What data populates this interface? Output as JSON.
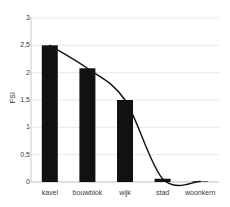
{
  "chart_data": {
    "type": "bar",
    "title": "",
    "subtitle": "",
    "xlabel": "",
    "ylabel": "FSI",
    "categories": [
      "kavel",
      "bouwblok",
      "wijk",
      "stad",
      "woonkern"
    ],
    "values": [
      2.5,
      2.08,
      1.5,
      0.06,
      0.01
    ],
    "series": [
      {
        "name": "FSI",
        "type": "bar",
        "values": [
          2.5,
          2.08,
          1.5,
          0.06,
          0.01
        ]
      },
      {
        "name": "FSI trend curve",
        "type": "line",
        "values": [
          2.5,
          2.08,
          1.5,
          0.06,
          0.01
        ]
      }
    ],
    "ylim": [
      0,
      3
    ],
    "yticks": [
      0,
      0.5,
      1,
      1.5,
      2,
      2.5,
      3
    ],
    "ytick_labels": [
      "0",
      "0,5",
      "1",
      "1,5",
      "2",
      "2,5",
      "3"
    ],
    "grid": true,
    "grid_axis": "y",
    "legend": false,
    "legend_position": "none",
    "decimal_separator": ",",
    "colors": {
      "bar": "#111111",
      "curve": "#111111",
      "grid": "#e8e8e8",
      "axis": "#c9c9c9",
      "text": "#3a3a3a",
      "background": "#ffffff"
    }
  },
  "axes": {
    "y_title": "FSI",
    "y_tick_labels": [
      "3",
      "2,5",
      "2",
      "1,5",
      "1",
      "0,5",
      "0"
    ],
    "x_tick_labels": [
      "kavel",
      "bouwblok",
      "wijk",
      "stad",
      "woonkern"
    ]
  }
}
